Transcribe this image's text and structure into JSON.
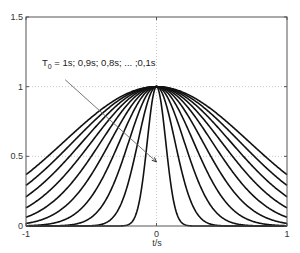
{
  "chart_data": {
    "type": "line",
    "title": "",
    "xlabel": "t/s",
    "ylabel": "",
    "xlim": [
      -1,
      1
    ],
    "ylim": [
      0,
      1.5
    ],
    "xticks": [
      -1,
      0,
      1
    ],
    "xtick_labels": [
      "-1",
      "0",
      "1"
    ],
    "yticks": [
      0,
      0.5,
      1,
      1.5
    ],
    "ytick_labels": [
      "0",
      "0.5",
      "1",
      "1.5"
    ],
    "grid": {
      "x": [
        0
      ],
      "y": [
        1,
        0.5
      ],
      "style": "dotted"
    },
    "legend": null,
    "function": "exp(-(t/T0)^2)",
    "series": [
      {
        "name": "T0 = 1s",
        "T0": 1.0,
        "value_at_t_pm1": 0.37
      },
      {
        "name": "T0 = 0.9s",
        "T0": 0.9,
        "value_at_t_pm1": 0.29
      },
      {
        "name": "T0 = 0.8s",
        "T0": 0.8,
        "value_at_t_pm1": 0.21
      },
      {
        "name": "T0 = 0.7s",
        "T0": 0.7,
        "value_at_t_pm1": 0.13
      },
      {
        "name": "T0 = 0.6s",
        "T0": 0.6,
        "value_at_t_pm1": 0.06
      },
      {
        "name": "T0 = 0.5s",
        "T0": 0.5,
        "value_at_t_pm1": 0.02
      },
      {
        "name": "T0 = 0.4s",
        "T0": 0.4,
        "value_at_t_pm1": 0.0
      },
      {
        "name": "T0 = 0.3s",
        "T0": 0.3,
        "value_at_t_pm1": 0.0
      },
      {
        "name": "T0 = 0.2s",
        "T0": 0.2,
        "value_at_t_pm1": 0.0
      },
      {
        "name": "T0 = 0.1s",
        "T0": 0.1,
        "value_at_t_pm1": 0.0
      }
    ],
    "annotations": [
      {
        "text_main": "T",
        "text_sub": "0",
        "text_rest": " = 1s; 0,9s; 0,8s; ... ;0,1s",
        "arrow_from": [
          -0.7,
          1.05
        ],
        "arrow_to": [
          0.0,
          0.46
        ]
      }
    ]
  },
  "labels": {
    "xlabel": "t/s",
    "annot_main": "T",
    "annot_sub": "0",
    "annot_rest": " = 1s; 0,9s; 0,8s; ... ;0,1s"
  },
  "colors": {
    "curve": "#111111",
    "frame": "#555555",
    "grid": "#bbbbbb",
    "arrow": "#666666"
  }
}
